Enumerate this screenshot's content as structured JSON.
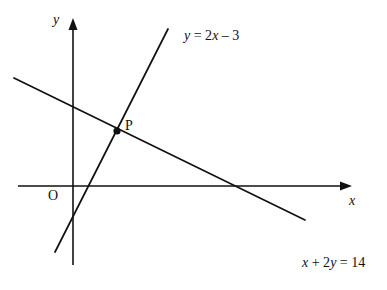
{
  "figure": {
    "type": "coordinate-graph",
    "width": 387,
    "height": 290,
    "background_color": "#ffffff",
    "stroke_color": "#111111"
  },
  "axes": {
    "x_label": "x",
    "y_label": "y",
    "origin_label": "O",
    "x_axis": {
      "start": [
        18,
        186
      ],
      "end": [
        352,
        186
      ],
      "arrow": "right"
    },
    "y_axis": {
      "start": [
        73,
        265
      ],
      "end": [
        73,
        18
      ],
      "arrow": "up"
    }
  },
  "points": [
    {
      "label": "P",
      "screen": [
        117,
        131
      ],
      "marker": "filled-circle"
    }
  ],
  "labels": {
    "line1_equation": "y = 2x – 3",
    "line2_equation": "x + 2y = 14"
  },
  "chart_data": {
    "type": "line",
    "title": "",
    "xlabel": "x",
    "ylabel": "y",
    "grid": false,
    "legend": "none",
    "origin_label": "O",
    "annotations": [
      {
        "text": "y = 2x – 3",
        "at": [
          185,
          41
        ]
      },
      {
        "text": "x + 2y = 14",
        "at": [
          303,
          268
        ]
      },
      {
        "text": "P",
        "at": [
          127,
          127
        ]
      }
    ],
    "series": [
      {
        "name": "y = 2x – 3",
        "equation": "y = 2x - 3",
        "slope": 2,
        "intercept": -3,
        "screen_points": [
          [
            55,
            252
          ],
          [
            168,
            29
          ]
        ]
      },
      {
        "name": "x + 2y = 14",
        "equation": "x + 2y = 14",
        "slope": -0.5,
        "intercept": 7,
        "screen_points": [
          [
            14,
            78
          ],
          [
            305,
            220
          ]
        ]
      }
    ],
    "intersection": {
      "label": "P",
      "x": 4,
      "y": 5,
      "screen": [
        117,
        131
      ]
    }
  }
}
